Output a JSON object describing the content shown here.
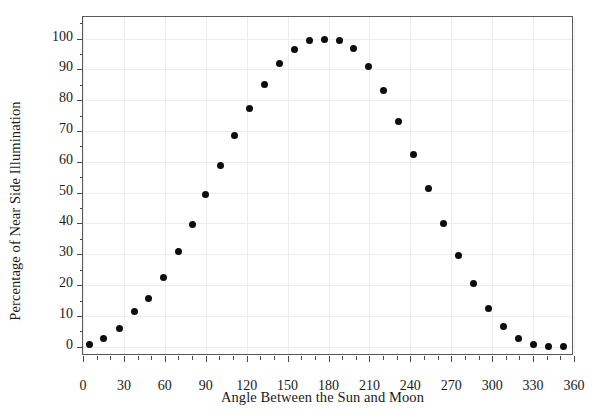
{
  "chart_data": {
    "type": "scatter",
    "title": "",
    "xlabel": "Angle Between the Sun and Moon",
    "ylabel": "Percentage of Near Side Illumination",
    "xlim": [
      0,
      360
    ],
    "ylim": [
      -3,
      107
    ],
    "xticks": [
      0,
      30,
      60,
      90,
      120,
      150,
      180,
      210,
      240,
      270,
      300,
      330,
      360
    ],
    "yticks": [
      0,
      10,
      20,
      30,
      40,
      50,
      60,
      70,
      80,
      90,
      100
    ],
    "xtick_labels": [
      "0",
      "30",
      "60",
      "90",
      "120",
      "150",
      "180",
      "210",
      "240",
      "270",
      "300",
      "330",
      "360"
    ],
    "ytick_labels": [
      "0",
      "10",
      "20",
      "30",
      "40",
      "50",
      "60",
      "70",
      "80",
      "90",
      "100"
    ],
    "xminor_step": 10,
    "yminor_step": 5,
    "grid": true,
    "legend": null,
    "marker": "filled-circle",
    "marker_color": "#0d0d0d",
    "x": [
      5,
      15,
      27,
      38,
      48,
      59,
      70,
      80,
      90,
      101,
      111,
      122,
      133,
      144,
      155,
      166,
      175,
      186,
      196,
      207,
      217,
      228,
      238,
      249,
      259,
      270,
      280,
      291,
      302,
      312,
      323,
      333,
      350
    ],
    "y": [
      0.8,
      2.6,
      6.0,
      11.3,
      15.5,
      22.4,
      30.8,
      39.8,
      49.4,
      58.9,
      68.4,
      77.3,
      85.2,
      91.9,
      96.6,
      99.3,
      99.7,
      99.3,
      96.8,
      90.8,
      83.1,
      73.0,
      62.5,
      51.3,
      40.1,
      29.6,
      20.6,
      12.3,
      6.6,
      2.7,
      0.3,
      0.0,
      0.0
    ],
    "points": [
      {
        "x": 5,
        "y": 0.8
      },
      {
        "x": 15,
        "y": 2.6
      },
      {
        "x": 27,
        "y": 6.0
      },
      {
        "x": 38,
        "y": 11.3
      },
      {
        "x": 48,
        "y": 15.5
      },
      {
        "x": 59,
        "y": 22.4
      },
      {
        "x": 70,
        "y": 30.8
      },
      {
        "x": 80,
        "y": 39.8
      },
      {
        "x": 90,
        "y": 49.4
      },
      {
        "x": 101,
        "y": 58.9
      },
      {
        "x": 111,
        "y": 68.4
      },
      {
        "x": 122,
        "y": 77.3
      },
      {
        "x": 133,
        "y": 85.2
      },
      {
        "x": 144,
        "y": 91.9
      },
      {
        "x": 155,
        "y": 96.6
      },
      {
        "x": 166,
        "y": 99.3
      },
      {
        "x": 177,
        "y": 99.7
      },
      {
        "x": 188,
        "y": 99.3
      },
      {
        "x": 198,
        "y": 96.8
      },
      {
        "x": 209,
        "y": 90.8
      },
      {
        "x": 220,
        "y": 83.1
      },
      {
        "x": 231,
        "y": 73.0
      },
      {
        "x": 242,
        "y": 62.5
      },
      {
        "x": 253,
        "y": 51.3
      },
      {
        "x": 264,
        "y": 40.1
      },
      {
        "x": 275,
        "y": 29.6
      },
      {
        "x": 286,
        "y": 20.6
      },
      {
        "x": 297,
        "y": 12.3
      },
      {
        "x": 308,
        "y": 6.6
      },
      {
        "x": 319,
        "y": 2.7
      },
      {
        "x": 330,
        "y": 0.8
      },
      {
        "x": 341,
        "y": 0.2
      },
      {
        "x": 352,
        "y": 0.0
      }
    ]
  }
}
